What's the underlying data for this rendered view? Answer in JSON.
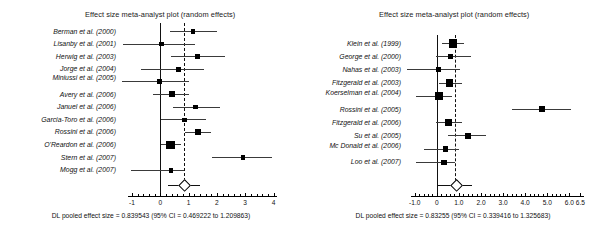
{
  "figure": {
    "background": "#ffffff",
    "accent": "#000000"
  },
  "chart_data": [
    {
      "type": "forest",
      "panel": "left",
      "title": "Effect size meta-analyst plot (random effects)",
      "xlabel": "",
      "ylabel": "",
      "xlim": [
        -1.35,
        4.3
      ],
      "xticks": [
        -1,
        0,
        1,
        2,
        3,
        4
      ],
      "xticklabels": [
        "-1",
        "0",
        "1",
        "2",
        "3",
        "4"
      ],
      "grid": false,
      "null_line": 0,
      "pooled_line": 0.839543,
      "pooled_label": "DL pooled effect size = 0.839543 (95% CI = 0.469222 to 1.209863)",
      "pooled": {
        "estimate": 0.839543,
        "ci_low": 0.469222,
        "ci_high": 1.209863
      },
      "studies": [
        {
          "label": "Berman et al. (2000)",
          "estimate": 1.16,
          "ci_low": 0.33,
          "ci_high": 2.02,
          "weight": 0.3
        },
        {
          "label": "Lisanby et al. (2001)",
          "estimate": 0.05,
          "ci_low": -1.32,
          "ci_high": 1.22,
          "weight": 0.33
        },
        {
          "label": "Herwig et al. (2003)",
          "estimate": 1.31,
          "ci_low": 0.37,
          "ci_high": 2.28,
          "weight": 0.45
        },
        {
          "label": "Jorge et al. (2004)",
          "estimate": 0.64,
          "ci_low": -0.67,
          "ci_high": 1.55,
          "weight": 0.3
        },
        {
          "label": "Miniussi et al. (2005)",
          "estimate": -0.02,
          "ci_low": -1.35,
          "ci_high": 1.0,
          "weight": 0.36
        },
        {
          "label": "Avery et al. (2006)",
          "estimate": 0.42,
          "ci_low": -0.25,
          "ci_high": 1.02,
          "weight": 0.55
        },
        {
          "label": "Januel et al. (2006)",
          "estimate": 1.25,
          "ci_low": 0.44,
          "ci_high": 2.12,
          "weight": 0.32
        },
        {
          "label": "Garcia-Toro et al. (2006)",
          "estimate": 0.86,
          "ci_low": 0.02,
          "ci_high": 1.63,
          "weight": 0.29
        },
        {
          "label": "Rossini et al. (2006)",
          "estimate": 1.34,
          "ci_low": 0.88,
          "ci_high": 1.79,
          "weight": 0.5
        },
        {
          "label": "O'Reardon et al. (2006)",
          "estimate": 0.36,
          "ci_low": 0.02,
          "ci_high": 0.72,
          "weight": 1.0
        },
        {
          "label": "Stern et al. (2007)",
          "estimate": 2.93,
          "ci_low": 1.84,
          "ci_high": 3.94,
          "weight": 0.32
        },
        {
          "label": "Mogg et al. (2007)",
          "estimate": 0.38,
          "ci_low": -1.02,
          "ci_high": 0.85,
          "weight": 0.38
        }
      ]
    },
    {
      "type": "forest",
      "panel": "right",
      "title": "Effect size meta-analyst plot (random effects)",
      "xlabel": "",
      "ylabel": "",
      "xlim": [
        -1.35,
        6.8
      ],
      "xticks": [
        -1.0,
        0,
        1.0,
        2.0,
        3.0,
        4.0,
        5.0,
        6.0,
        6.5
      ],
      "xticklabels": [
        "-1.0",
        "0",
        "1.0",
        "2.0",
        "3.0",
        "4.0",
        "5.0",
        "6.0",
        "6.5"
      ],
      "grid": false,
      "null_line": 0,
      "pooled_line": 0.83255,
      "pooled_label": "DL pooled effect size = 0.83255  (95% CI = 0.339416 to 1.325683)",
      "pooled": {
        "estimate": 0.83255,
        "ci_low": 0.339416,
        "ci_high": 1.325683
      },
      "studies": [
        {
          "label": "Klein et al. (1999)",
          "estimate": 0.72,
          "ci_low": 0.24,
          "ci_high": 1.22,
          "weight": 0.9
        },
        {
          "label": "George et al. (2000)",
          "estimate": 0.63,
          "ci_low": -0.02,
          "ci_high": 1.55,
          "weight": 0.36
        },
        {
          "label": "Nahas et al. (2003)",
          "estimate": 0.08,
          "ci_low": -1.35,
          "ci_high": 1.03,
          "weight": 0.4
        },
        {
          "label": "Fitzgerald et al. (2003)",
          "estimate": 0.57,
          "ci_low": 0.1,
          "ci_high": 1.16,
          "weight": 0.78
        },
        {
          "label": "Koerselman et al. (2004)",
          "estimate": 0.1,
          "ci_low": -0.95,
          "ci_high": 0.68,
          "weight": 0.82
        },
        {
          "label": "Rossini et al. (2005)",
          "estimate": 4.75,
          "ci_low": 3.4,
          "ci_high": 6.06,
          "weight": 0.55
        },
        {
          "label": "Fitzgerald et al. (2006)",
          "estimate": 0.52,
          "ci_low": -0.05,
          "ci_high": 1.15,
          "weight": 0.62
        },
        {
          "label": "Su et al. (2005)",
          "estimate": 1.4,
          "ci_low": 0.5,
          "ci_high": 2.25,
          "weight": 0.58
        },
        {
          "label": "Mc Donald et al. (2006)",
          "estimate": 0.4,
          "ci_low": -0.56,
          "ci_high": 1.02,
          "weight": 0.5
        },
        {
          "label": "Loo et al. (2007)",
          "estimate": 0.33,
          "ci_low": -0.95,
          "ci_high": 0.82,
          "weight": 0.46
        }
      ]
    }
  ]
}
